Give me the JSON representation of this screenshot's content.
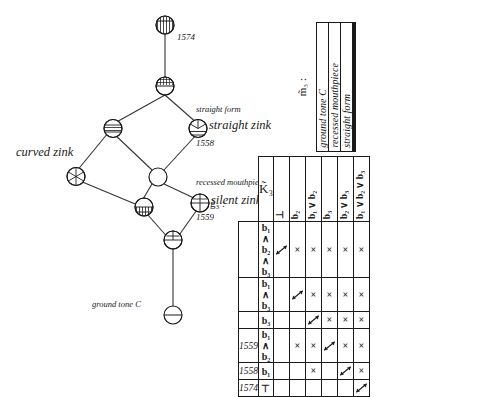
{
  "figure": {
    "type": "concept-lattice-and-cross-table"
  },
  "lattice": {
    "labels": [
      {
        "id": "year-1574",
        "text": "1574",
        "kind": "year"
      },
      {
        "id": "attr-straight-form",
        "text": "straight form",
        "kind": "attribute"
      },
      {
        "id": "obj-straight-zink",
        "text": "straight zink",
        "kind": "object"
      },
      {
        "id": "year-1558",
        "text": "1558",
        "kind": "year"
      },
      {
        "id": "obj-curved-zink",
        "text": "curved zink",
        "kind": "object"
      },
      {
        "id": "attr-recessed-mouthpiece",
        "text": "recessed mouthpiece",
        "kind": "attribute"
      },
      {
        "id": "obj-silent-zink",
        "text": "silent zink",
        "kind": "object"
      },
      {
        "id": "year-1559",
        "text": "1559",
        "kind": "year"
      },
      {
        "id": "attr-ground-tone-c",
        "text": "ground tone C",
        "kind": "attribute"
      }
    ],
    "nodes": [
      {
        "id": "n-top",
        "fill": "vertical-hatch-bottom"
      },
      {
        "id": "n-upper-mid",
        "fill": "cross-hatch-top"
      },
      {
        "id": "n-left-upper",
        "fill": "horizontal-band"
      },
      {
        "id": "n-straight",
        "fill": "radial-top-horizontal-bottom"
      },
      {
        "id": "n-center",
        "fill": "empty"
      },
      {
        "id": "n-curved",
        "fill": "radial-fan"
      },
      {
        "id": "n-lower-left",
        "fill": "vertical-hatch-bottom"
      },
      {
        "id": "n-silent",
        "fill": "quartered"
      },
      {
        "id": "n-lower-mid",
        "fill": "half-horizontal"
      },
      {
        "id": "n-bottom",
        "fill": "diameter-line"
      }
    ]
  },
  "upper_table": {
    "row_label": "m̃₃ :",
    "columns": [
      "ground tone C",
      "recessed mouthpiece",
      "straight form",
      "",
      "",
      ""
    ]
  },
  "lower_table": {
    "row_label": "g̃₃ :",
    "corner_label": "K̃₃",
    "column_headers": [
      "⊥",
      "b₂",
      "b₁ ∨ b₂",
      "b₃",
      "b₂ ∨ b₃",
      "b₁ ∨ b₂ ∨ b₃"
    ],
    "rows": [
      {
        "year": "",
        "object": "b₁ ∧ b₂ ∧ b₃",
        "cells": [
          "arrow",
          "x",
          "x",
          "x",
          "x",
          "x"
        ]
      },
      {
        "year": "",
        "object": "b₁ ∧ b₃",
        "cells": [
          "",
          "arrow",
          "x",
          "x",
          "x",
          "x"
        ]
      },
      {
        "year": "",
        "object": "b₃",
        "cells": [
          "",
          "",
          "arrow",
          "x",
          "x",
          "x"
        ]
      },
      {
        "year": "1559",
        "object": "b₁ ∧ b₂",
        "cells": [
          "",
          "x",
          "x",
          "arrow",
          "x",
          "x"
        ]
      },
      {
        "year": "1558",
        "object": "b₁",
        "cells": [
          "",
          "",
          "x",
          "",
          "arrow",
          "x"
        ]
      },
      {
        "year": "1574",
        "object": "⊤",
        "cells": [
          "",
          "",
          "",
          "",
          "",
          "arrow"
        ]
      }
    ],
    "symbols": {
      "cross": "×",
      "arrow": "double-headed-diagonal-arrow"
    }
  }
}
